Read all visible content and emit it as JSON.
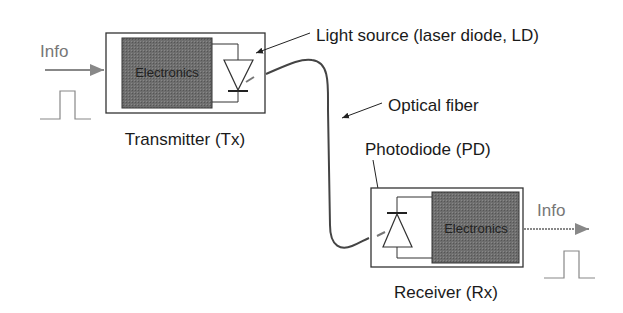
{
  "diagram": {
    "type": "optical-fiber-link",
    "transmitter": {
      "label": "Transmitter (Tx)",
      "block_label": "Electronics",
      "input_label": "Info"
    },
    "light_source_label": "Light source (laser diode, LD)",
    "fiber_label": "Optical fiber",
    "photodiode_label": "Photodiode (PD)",
    "receiver": {
      "label": "Receiver (Rx)",
      "block_label": "Electronics",
      "output_label": "Info"
    },
    "colors": {
      "electronics_fill": "#6b6b6b",
      "outline": "#333333",
      "info_signal": "#8a8a8a"
    }
  }
}
